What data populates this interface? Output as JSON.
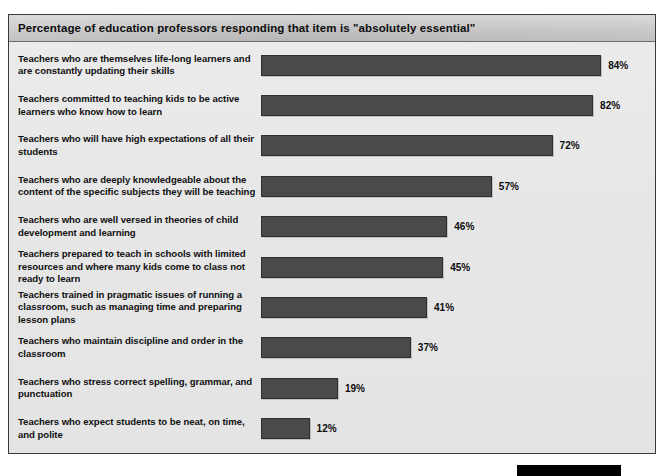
{
  "chart_data": {
    "type": "bar",
    "orientation": "horizontal",
    "title": "Percentage of education professors responding that item is \"absolutely essential\"",
    "xlabel": "",
    "ylabel": "",
    "xlim": [
      0,
      100
    ],
    "grid": false,
    "legend": null,
    "value_suffix": "%",
    "categories": [
      "Teachers who are themselves life-long learners and are constantly updating their skills",
      "Teachers committed to teaching kids to be active learners who know how to learn",
      "Teachers who will have high expectations of all their students",
      "Teachers who are deeply knowledgeable about the content of the specific subjects they will be teaching",
      "Teachers who are well versed in theories of child development and learning",
      "Teachers prepared to teach in schools with limited resources and where many kids come to class not ready to learn",
      "Teachers trained in pragmatic issues of running a classroom, such as managing time and preparing lesson plans",
      "Teachers who maintain discipline and order in the classroom",
      "Teachers who stress correct spelling, grammar, and punctuation",
      "Teachers who expect students to be neat, on time, and polite"
    ],
    "values": [
      84,
      82,
      72,
      57,
      46,
      45,
      41,
      37,
      19,
      12
    ],
    "value_labels": [
      "84%",
      "82%",
      "72%",
      "57%",
      "46%",
      "45%",
      "41%",
      "37%",
      "19%",
      "12%"
    ],
    "colors": {
      "bar": "#4a4a4a",
      "bar_border": "#2f2f2f",
      "panel_background": "#e9e9e9",
      "title_band": "#c2c2c2",
      "text": "#101010",
      "frame_border": "#3a3a3a",
      "marker_block": "#000000"
    }
  },
  "rows": [
    {
      "label": "Teachers who are themselves life-long learners and are constantly updating their skills",
      "value": 84,
      "value_label": "84%"
    },
    {
      "label": "Teachers committed to teaching kids to be active learners who know how to learn",
      "value": 82,
      "value_label": "82%"
    },
    {
      "label": "Teachers who will have high expectations of all their students",
      "value": 72,
      "value_label": "72%"
    },
    {
      "label": "Teachers who are deeply knowledgeable about the content of the specific subjects they will be teaching",
      "value": 57,
      "value_label": "57%"
    },
    {
      "label": "Teachers who are well versed in theories of child development and learning",
      "value": 46,
      "value_label": "46%"
    },
    {
      "label": "Teachers prepared to teach in schools with limited resources and where many kids come to class not ready to learn",
      "value": 45,
      "value_label": "45%"
    },
    {
      "label": "Teachers trained in pragmatic issues of running a classroom, such as managing time and preparing lesson plans",
      "value": 41,
      "value_label": "41%"
    },
    {
      "label": "Teachers who maintain discipline and order in the classroom",
      "value": 37,
      "value_label": "37%"
    },
    {
      "label": "Teachers who stress correct spelling, grammar, and punctuation",
      "value": 19,
      "value_label": "19%"
    },
    {
      "label": "Teachers who expect students to be neat, on time, and polite",
      "value": 12,
      "value_label": "12%"
    }
  ]
}
